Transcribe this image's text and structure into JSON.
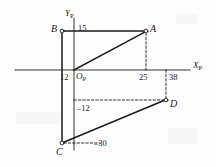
{
  "figure": {
    "background_color": "#fdfdfd",
    "line_color": "#1a1a1a",
    "axes": {
      "x_axis_label": "X",
      "x_axis_subscript": "P",
      "y_axis_label": "Y",
      "y_axis_subscript": "P",
      "origin_label": "O",
      "origin_subscript": "P"
    },
    "points": [
      {
        "name": "A",
        "label": "A",
        "px": 146,
        "py": 31,
        "x_value": 25,
        "y_value": 15
      },
      {
        "name": "B",
        "label": "B",
        "px": 62,
        "py": 31,
        "x_value": -12,
        "y_value": 15
      },
      {
        "name": "C",
        "label": "C",
        "px": 62,
        "py": 143,
        "x_value": -12,
        "y_value": -30
      },
      {
        "name": "D",
        "label": "D",
        "px": 166,
        "py": 100,
        "x_value": 38,
        "y_value": -12
      }
    ],
    "tick_labels": [
      {
        "name": "y-tick-15",
        "text": "15",
        "px": 78,
        "py": 24
      },
      {
        "name": "x-tick-12",
        "text": "12",
        "px": 60,
        "py": 73
      },
      {
        "name": "x-tick-25",
        "text": "25",
        "px": 139,
        "py": 73
      },
      {
        "name": "x-tick-38",
        "text": "38",
        "px": 169,
        "py": 73
      },
      {
        "name": "y-tick-neg12",
        "text": "–12",
        "px": 77,
        "py": 104
      },
      {
        "name": "y-tick-neg30",
        "text": "–30",
        "px": 94,
        "py": 140
      }
    ]
  }
}
